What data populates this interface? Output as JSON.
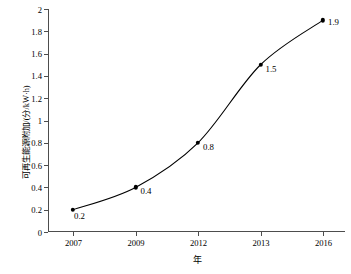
{
  "chart_data": {
    "type": "line",
    "title": "",
    "subtitle": "",
    "xlabel": "年",
    "ylabel": "可再生能源附加/(分/kW·h)",
    "categories": [
      "2007",
      "2009",
      "2012",
      "2013",
      "2016"
    ],
    "values": [
      0.2,
      0.4,
      0.8,
      1.5,
      1.9
    ],
    "point_labels": [
      "0.2",
      "0.4",
      "0.8",
      "1.5",
      "1.9"
    ],
    "series": [
      {
        "name": "可再生能源附加",
        "values": [
          0.2,
          0.4,
          0.8,
          1.5,
          1.9
        ]
      }
    ],
    "ylim": [
      0,
      2
    ],
    "yticks": [
      0,
      0.2,
      0.4,
      0.6,
      0.8,
      1,
      1.2,
      1.4,
      1.6,
      1.8,
      2
    ],
    "ytick_labels": [
      "0",
      "0.2",
      "0.4",
      "0.6",
      "0.8",
      "1",
      "1.2",
      "1.4",
      "1.6",
      "1.8",
      "2"
    ],
    "xtick_labels": [
      "2007",
      "2009",
      "2012",
      "2013",
      "2016"
    ],
    "grid": false,
    "legend": false,
    "legend_position": "none",
    "line_color": "#000000",
    "marker_color": "#000000",
    "marker_style": "filled-circle",
    "interpolation": "smooth",
    "background_color": "#ffffff",
    "axis_color": "#4d4d4d"
  }
}
